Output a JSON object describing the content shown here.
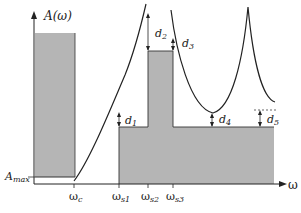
{
  "figure": {
    "y_axis_label": "A(ω)",
    "x_axis_label": "ω",
    "amax_label": "A",
    "amax_sub": "max",
    "x_ticks": [
      {
        "main": "ω",
        "sub": "c",
        "x": 74
      },
      {
        "main": "ω",
        "sub": "s1",
        "x": 119
      },
      {
        "main": "ω",
        "sub": "s2",
        "x": 148
      },
      {
        "main": "ω",
        "sub": "s3",
        "x": 173
      }
    ],
    "deviations": [
      {
        "main": "d",
        "sub": "1"
      },
      {
        "main": "d",
        "sub": "2"
      },
      {
        "main": "d",
        "sub": "3"
      },
      {
        "main": "d",
        "sub": "4"
      },
      {
        "main": "d",
        "sub": "5"
      }
    ],
    "colors": {
      "fill": "#b4b4b4",
      "line": "#222222"
    }
  }
}
